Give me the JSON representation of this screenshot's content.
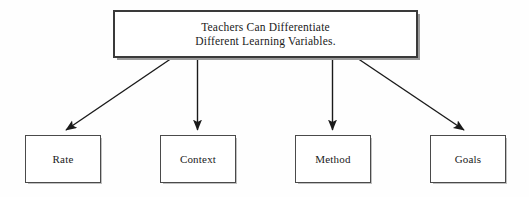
{
  "diagram": {
    "type": "hierarchy-tree",
    "title": "Teachers Can Differentiate Different Learning Variables.",
    "background_color": "#fefefe",
    "line_color": "#1a1a1a",
    "text_color": "#1a1a1a",
    "box_border_color": "#3a3a3a",
    "root": {
      "line1": "Teachers Can Differentiate",
      "line2": "Different Learning Variables."
    },
    "children": [
      {
        "label": "Rate"
      },
      {
        "label": "Context"
      },
      {
        "label": "Method"
      },
      {
        "label": "Goals"
      }
    ],
    "connectors": [
      {
        "from": "root",
        "to": "Rate",
        "style": "diagonal-left"
      },
      {
        "from": "root",
        "to": "Context",
        "style": "vertical"
      },
      {
        "from": "root",
        "to": "Method",
        "style": "vertical"
      },
      {
        "from": "root",
        "to": "Goals",
        "style": "diagonal-right"
      }
    ]
  }
}
